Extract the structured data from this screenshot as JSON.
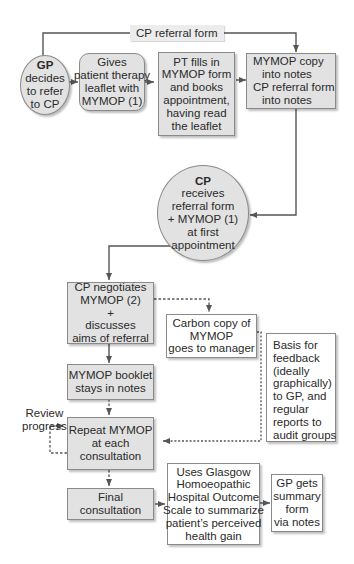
{
  "diagram": {
    "colors": {
      "box_fill_gray": "#e2e2e2",
      "box_fill_white": "#ffffff",
      "border": "#8a8a8a",
      "line": "#555555",
      "text": "#2a2a2a"
    },
    "connector_label": "CP referral form",
    "nodes": {
      "gp": {
        "title": "GP",
        "lines": [
          "decides",
          "to refer",
          "to CP"
        ]
      },
      "gives_leaflet": {
        "lines": [
          "Gives",
          "patient therapy",
          "leaflet with",
          "MYMOP (1)"
        ]
      },
      "pt_fills": {
        "lines": [
          "PT fills in",
          "MYMOP form",
          "and books",
          "appointment,",
          "having read",
          "the leaflet"
        ]
      },
      "copy_notes": {
        "lines": [
          "MYMOP copy",
          "into notes",
          "CP referral form",
          "into notes"
        ]
      },
      "cp_receives": {
        "title": "CP",
        "lines": [
          "receives",
          "referral form",
          "+ MYMOP (1)",
          "at first",
          "appointment"
        ]
      },
      "cp_negotiates": {
        "lines": [
          "CP negotiates",
          "MYMOP (2)",
          "+",
          "discusses",
          "aims of referral"
        ]
      },
      "carbon_copy": {
        "lines": [
          "Carbon copy of",
          "MYMOP",
          "goes to manager"
        ]
      },
      "basis_feedback": {
        "lines": [
          "Basis for",
          "feedback",
          "(ideally",
          "graphically)",
          "to GP, and",
          "regular",
          "reports to",
          "audit groups"
        ]
      },
      "booklet": {
        "lines": [
          "MYMOP booklet",
          "stays in notes"
        ]
      },
      "repeat": {
        "lines": [
          "Repeat MYMOP",
          "at each",
          "consultation"
        ]
      },
      "final": {
        "lines": [
          "Final",
          "consultation"
        ]
      },
      "glasgow": {
        "lines": [
          "Uses Glasgow",
          "Homoeopathic",
          "Hospital Outcome",
          "Scale to summarize",
          "patient’s perceived",
          "health gain"
        ]
      },
      "gp_summary": {
        "lines": [
          "GP gets",
          "summary",
          "form",
          "via notes"
        ]
      }
    },
    "review_label": [
      "Review",
      "progress"
    ]
  }
}
